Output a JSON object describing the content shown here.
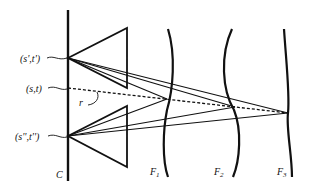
{
  "diagram": {
    "type": "light-field ray diagram",
    "camera_plane_label": "C",
    "camera_points": [
      {
        "id": "sp",
        "label": "(s',t')",
        "x": 68,
        "y": 58
      },
      {
        "id": "s",
        "label": "(s,t)",
        "x": 68,
        "y": 88
      },
      {
        "id": "spp",
        "label": "(s'',t'')",
        "x": 68,
        "y": 136
      }
    ],
    "ray_label": "r",
    "focal_planes": [
      {
        "id": "F1",
        "label": "F",
        "subscript": "1",
        "x": 167,
        "y": 99
      },
      {
        "id": "F2",
        "label": "F",
        "subscript": "2",
        "x": 235,
        "y": 107
      },
      {
        "id": "F3",
        "label": "F",
        "subscript": "3",
        "x": 288,
        "y": 113
      }
    ],
    "colors": {
      "ink": "#111111",
      "background": "#ffffff"
    }
  }
}
